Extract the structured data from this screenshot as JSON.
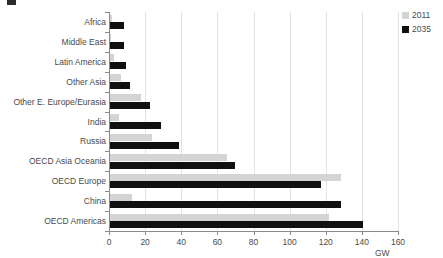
{
  "chart_data": {
    "type": "bar",
    "orientation": "horizontal",
    "title": "",
    "xlabel": "GW",
    "ylabel": "",
    "xlim": [
      0,
      160
    ],
    "xticks": [
      0,
      20,
      40,
      60,
      80,
      100,
      120,
      140,
      160
    ],
    "grid": true,
    "legend_position": "top-right",
    "categories": [
      "Africa",
      "Middle East",
      "Latin America",
      "Other Asia",
      "Other E. Europe/Eurasia",
      "India",
      "Russia",
      "OECD Asia Oceania",
      "OECD Europe",
      "China",
      "OECD Americas"
    ],
    "series": [
      {
        "name": "2011",
        "color": "#d4d4d4",
        "values": [
          1,
          0.5,
          2,
          6,
          17,
          5,
          23,
          65,
          128,
          12,
          121
        ]
      },
      {
        "name": "2035",
        "color": "#101010",
        "values": [
          8,
          8,
          9,
          11,
          22,
          28,
          38,
          69,
          117,
          128,
          140
        ]
      }
    ]
  },
  "legend": {
    "items": [
      {
        "label": "2011",
        "color": "#d4d4d4"
      },
      {
        "label": "2035",
        "color": "#101010"
      }
    ]
  },
  "axis": {
    "x_title": "GW",
    "tick_labels": [
      "0",
      "20",
      "40",
      "60",
      "80",
      "100",
      "120",
      "140",
      "160"
    ]
  }
}
